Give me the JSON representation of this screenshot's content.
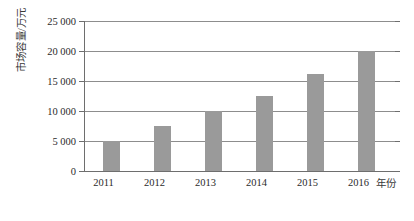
{
  "chart_data": {
    "type": "bar",
    "title": "",
    "subtitle": "",
    "xlabel": "年份",
    "ylabel": "市场容量/万元",
    "categories": [
      "2011",
      "2012",
      "2013",
      "2014",
      "2015",
      "2016"
    ],
    "values": [
      5000,
      7500,
      10000,
      12500,
      16200,
      20000
    ],
    "series": [
      {
        "name": "市场容量",
        "values": [
          5000,
          7500,
          10000,
          12500,
          16200,
          20000
        ]
      }
    ],
    "ylim": [
      0,
      25000
    ],
    "xlim": [
      0,
      6
    ],
    "ytick_labels": [
      "0",
      "5 000",
      "10 000",
      "15 000",
      "20 000",
      "25 000"
    ],
    "ytick_values": [
      0,
      5000,
      10000,
      15000,
      20000,
      25000
    ],
    "xtick_labels": [
      "2011",
      "2012",
      "2013",
      "2014",
      "2015",
      "2016"
    ],
    "grid": true,
    "grid_axis": "y",
    "legend": false,
    "legend_position": "none",
    "annotations": [],
    "colors": {
      "bar_fill": "#9a9a9a",
      "gridline": "#8d8d8d",
      "axis": "#6e6e6e",
      "text": "#2b2b2b",
      "background": "#ffffff"
    }
  }
}
